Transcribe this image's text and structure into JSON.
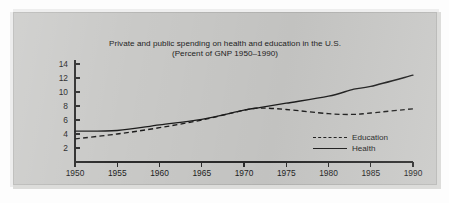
{
  "figure": {
    "panel_background": "#c9c9c7",
    "ink_color": "#1c1c1c"
  },
  "chart_data": {
    "type": "line",
    "title": "Private and public spending on health and education in the U.S.",
    "subtitle": "(Percent of GNP 1950–1990)",
    "xlabel": "",
    "ylabel": "",
    "xlim": [
      1950,
      1990
    ],
    "ylim": [
      0,
      14
    ],
    "grid": false,
    "legend_position": "inside-right",
    "xticks": [
      1950,
      1955,
      1960,
      1965,
      1970,
      1975,
      1980,
      1985,
      1990
    ],
    "xtick_labels": [
      "1950",
      "1955",
      "1960",
      "1965",
      "1970",
      "1975",
      "1980",
      "1985",
      "1990"
    ],
    "yticks": [
      2,
      4,
      6,
      8,
      10,
      12,
      14
    ],
    "ytick_labels": [
      "2",
      "4",
      "6",
      "8",
      "10",
      "12",
      "14"
    ],
    "x": [
      1950,
      1955,
      1960,
      1965,
      1970,
      1972,
      1975,
      1980,
      1983,
      1985,
      1990
    ],
    "series": [
      {
        "name": "Education",
        "style": "dashed",
        "values": [
          3.3,
          4.0,
          4.9,
          6.0,
          7.4,
          7.7,
          7.5,
          6.9,
          6.8,
          7.0,
          7.6
        ]
      },
      {
        "name": "Health",
        "style": "solid",
        "values": [
          4.4,
          4.5,
          5.3,
          6.1,
          7.4,
          7.8,
          8.4,
          9.4,
          10.4,
          10.8,
          12.4
        ]
      }
    ]
  },
  "legend": {
    "entries": [
      {
        "label": "Education",
        "style": "dashed"
      },
      {
        "label": "Health",
        "style": "solid"
      }
    ]
  }
}
